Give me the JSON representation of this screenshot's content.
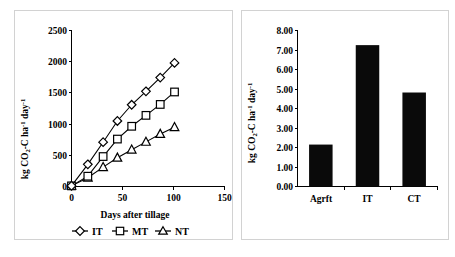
{
  "figure": {
    "panels": [
      "line-chart-panel",
      "bar-chart-panel"
    ]
  },
  "chart_data": [
    {
      "id": "left",
      "type": "line",
      "title": "",
      "xlabel": "Days after tillage",
      "ylabel": "kg CO2-C ha-1 day-1",
      "ylabel_parts": {
        "prefix": "kg CO",
        "sub1": "2",
        "mid": "-C ha",
        "sup1": "-1",
        "mid2": " day",
        "sup2": "-1"
      },
      "xlim": [
        0,
        150
      ],
      "ylim": [
        0,
        2500
      ],
      "xticks": [
        0,
        50,
        100,
        150
      ],
      "xtick_labels": [
        "0",
        "50",
        "100",
        "150"
      ],
      "yticks": [
        0,
        500,
        1000,
        1500,
        2000,
        2500
      ],
      "ytick_labels": [
        "0",
        "500",
        "1000",
        "1500",
        "2000",
        "2500"
      ],
      "grid": false,
      "legend_position": "bottom",
      "x": [
        0,
        16,
        31,
        45,
        59,
        73,
        87,
        101
      ],
      "series": [
        {
          "name": "IT",
          "marker": "diamond",
          "values": [
            10,
            355,
            710,
            1050,
            1310,
            1525,
            1745,
            1980
          ]
        },
        {
          "name": "MT",
          "marker": "square",
          "values": [
            10,
            165,
            480,
            760,
            965,
            1140,
            1315,
            1515
          ]
        },
        {
          "name": "NT",
          "marker": "triangle",
          "values": [
            10,
            140,
            310,
            460,
            590,
            715,
            840,
            950
          ]
        }
      ]
    },
    {
      "id": "right",
      "type": "bar",
      "title": "",
      "xlabel": "",
      "ylabel": "kg CO2-C ha-1 day-1",
      "ylabel_parts": {
        "prefix": "kg CO",
        "sub1": "2",
        "mid": "-C ha",
        "sup1": "-1",
        "mid2": " day",
        "sup2": "-1"
      },
      "ylim": [
        0,
        8
      ],
      "yticks": [
        0,
        1,
        2,
        3,
        4,
        5,
        6,
        7,
        8
      ],
      "ytick_labels": [
        "0.00",
        "1.00",
        "2.00",
        "3.00",
        "4.00",
        "5.00",
        "6.00",
        "7.00",
        "8.00"
      ],
      "grid": false,
      "categories": [
        "Agrft",
        "IT",
        "CT"
      ],
      "values": [
        2.15,
        7.25,
        4.82
      ],
      "bar_color": "#0a0a0a"
    }
  ]
}
